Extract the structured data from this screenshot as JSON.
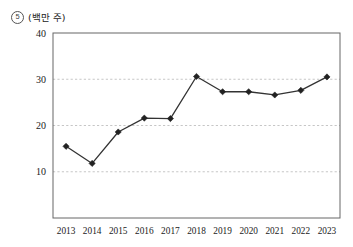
{
  "figure": {
    "number_label": "5",
    "unit_label": "(백만 주)"
  },
  "chart_data": {
    "type": "line",
    "title": "",
    "subtitle": "",
    "xlabel": "",
    "ylabel": "(백만 주)",
    "categories": [
      "2013",
      "2014",
      "2015",
      "2016",
      "2017",
      "2018",
      "2019",
      "2020",
      "2021",
      "2022",
      "2023"
    ],
    "values": [
      15.5,
      11.8,
      18.6,
      21.6,
      21.5,
      30.6,
      27.3,
      27.3,
      26.6,
      27.6,
      30.5
    ],
    "series": [
      {
        "name": "주식수",
        "values": [
          15.5,
          11.8,
          18.6,
          21.6,
          21.5,
          30.6,
          27.3,
          27.3,
          26.6,
          27.6,
          30.5
        ]
      }
    ],
    "ylim": [
      0,
      40
    ],
    "yticks": [
      10,
      20,
      30,
      40
    ],
    "ytick_labels": [
      "10",
      "20",
      "30",
      "40"
    ],
    "xtick_labels": [
      "2013",
      "2014",
      "2015",
      "2016",
      "2017",
      "2018",
      "2019",
      "2020",
      "2021",
      "2022",
      "2023"
    ],
    "grid": true,
    "grid_axis": "y",
    "grid_style": "dashed",
    "legend": false,
    "legend_position": "none",
    "marker": "diamond",
    "line_color": "#333333",
    "marker_color": "#222222",
    "grid_color": "#bfbfbf",
    "axis_color": "#555555",
    "annotations": []
  }
}
